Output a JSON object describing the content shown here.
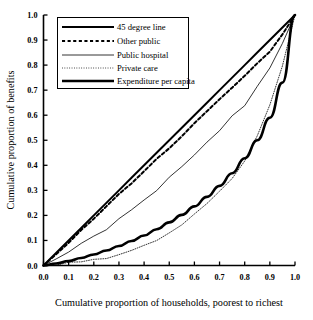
{
  "chart_data": {
    "type": "line",
    "title": "",
    "xlabel": "Cumulative proportion of households, poorest to richest",
    "ylabel": "Cumulative proportion of benefits",
    "xlim": [
      0.0,
      1.0
    ],
    "ylim": [
      0.0,
      1.0
    ],
    "grid": false,
    "legend_position": "upper-left",
    "xticks": [
      "0.0",
      "0.1",
      "0.2",
      "0.3",
      "0.4",
      "0.5",
      "0.6",
      "0.7",
      "0.8",
      "0.9",
      "1.0"
    ],
    "yticks": [
      "0.0",
      "0.1",
      "0.2",
      "0.3",
      "0.4",
      "0.5",
      "0.6",
      "0.7",
      "0.8",
      "0.9",
      "1.0"
    ],
    "x": [
      0.0,
      0.05,
      0.1,
      0.15,
      0.2,
      0.25,
      0.3,
      0.35,
      0.4,
      0.45,
      0.5,
      0.55,
      0.6,
      0.65,
      0.7,
      0.75,
      0.8,
      0.85,
      0.9,
      0.95,
      1.0
    ],
    "series": [
      {
        "name": "45 degree line",
        "style": "solid",
        "width": 2.0,
        "color": "#000000",
        "values": [
          0.0,
          0.05,
          0.1,
          0.15,
          0.2,
          0.25,
          0.3,
          0.35,
          0.4,
          0.45,
          0.5,
          0.55,
          0.6,
          0.65,
          0.7,
          0.75,
          0.8,
          0.85,
          0.9,
          0.95,
          1.0
        ]
      },
      {
        "name": "Other public",
        "style": "dashed",
        "width": 2.0,
        "color": "#000000",
        "values": [
          0.0,
          0.046,
          0.093,
          0.14,
          0.188,
          0.235,
          0.283,
          0.33,
          0.378,
          0.424,
          0.47,
          0.518,
          0.566,
          0.614,
          0.662,
          0.71,
          0.757,
          0.806,
          0.856,
          0.921,
          1.0
        ]
      },
      {
        "name": "Public hospital",
        "style": "solid",
        "width": 0.8,
        "color": "#000000",
        "values": [
          0.0,
          0.026,
          0.054,
          0.082,
          0.112,
          0.146,
          0.182,
          0.22,
          0.258,
          0.305,
          0.355,
          0.4,
          0.445,
          0.495,
          0.545,
          0.595,
          0.645,
          0.71,
          0.785,
          0.88,
          1.0
        ]
      },
      {
        "name": "Private care",
        "style": "dotted",
        "width": 0.8,
        "color": "#000000",
        "values": [
          0.0,
          0.004,
          0.009,
          0.014,
          0.02,
          0.03,
          0.044,
          0.06,
          0.08,
          0.104,
          0.132,
          0.165,
          0.202,
          0.245,
          0.295,
          0.35,
          0.42,
          0.52,
          0.64,
          0.8,
          1.0
        ]
      },
      {
        "name": "Expenditure per capita",
        "style": "solid",
        "width": 2.6,
        "color": "#000000",
        "values": [
          0.0,
          0.008,
          0.018,
          0.03,
          0.044,
          0.06,
          0.078,
          0.098,
          0.12,
          0.145,
          0.172,
          0.202,
          0.236,
          0.274,
          0.318,
          0.368,
          0.428,
          0.5,
          0.59,
          0.73,
          1.0
        ]
      }
    ]
  },
  "legend": {
    "items": [
      {
        "label": "45 degree line"
      },
      {
        "label": "Other public"
      },
      {
        "label": "Public hospital"
      },
      {
        "label": "Private care"
      },
      {
        "label": "Expenditure per capita"
      }
    ]
  },
  "axes": {
    "x_label": "Cumulative proportion of households, poorest to richest",
    "y_label": "Cumulative proportion of benefits"
  }
}
